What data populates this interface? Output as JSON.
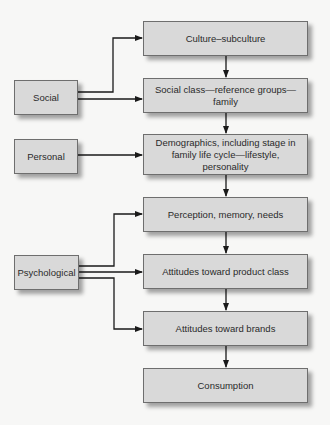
{
  "diagram": {
    "sources": [
      {
        "id": "social",
        "label": "Social"
      },
      {
        "id": "personal",
        "label": "Personal"
      },
      {
        "id": "psychological",
        "label": "Psychological"
      }
    ],
    "chain": [
      {
        "id": "culture",
        "label": "Culture–subculture"
      },
      {
        "id": "social-class",
        "label": "Social class—reference groups—family"
      },
      {
        "id": "demographics",
        "label": "Demographics, including stage in family life cycle—lifestyle, personality"
      },
      {
        "id": "perception",
        "label": "Perception, memory, needs"
      },
      {
        "id": "attitudes-product",
        "label": "Attitudes toward product class"
      },
      {
        "id": "attitudes-brands",
        "label": "Attitudes toward brands"
      },
      {
        "id": "consumption",
        "label": "Consumption"
      }
    ],
    "edges": [
      {
        "from": "social",
        "to": "culture"
      },
      {
        "from": "social",
        "to": "social-class"
      },
      {
        "from": "personal",
        "to": "demographics"
      },
      {
        "from": "psychological",
        "to": "perception"
      },
      {
        "from": "psychological",
        "to": "attitudes-product"
      },
      {
        "from": "psychological",
        "to": "attitudes-brands"
      },
      {
        "from": "culture",
        "to": "social-class"
      },
      {
        "from": "social-class",
        "to": "demographics"
      },
      {
        "from": "demographics",
        "to": "perception"
      },
      {
        "from": "perception",
        "to": "attitudes-product"
      },
      {
        "from": "attitudes-product",
        "to": "attitudes-brands"
      },
      {
        "from": "attitudes-brands",
        "to": "consumption"
      }
    ],
    "colors": {
      "box_fill": "#d9d9d9",
      "box_border": "#6e6e6e",
      "line": "#1a1a1a",
      "background": "#f7f7f6"
    }
  }
}
